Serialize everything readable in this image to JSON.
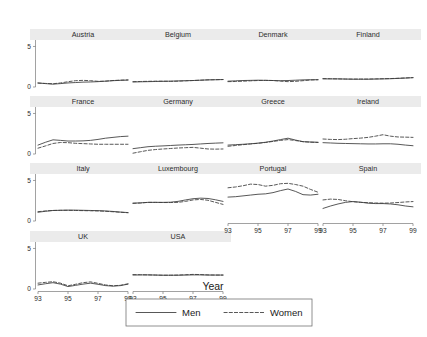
{
  "chart_data": {
    "type": "line",
    "title": "",
    "xlabel": "Year",
    "ylabel": "",
    "xlim": [
      93,
      99
    ],
    "ylim": [
      0,
      5.8
    ],
    "xticks": [
      93,
      95,
      97,
      99
    ],
    "xtick_labels": [
      "93",
      "95",
      "97",
      "99"
    ],
    "yticks": [
      0,
      5
    ],
    "ytick_labels": [
      "0",
      "5"
    ],
    "grid": false,
    "legend_position": "bottom-center",
    "legend": [
      {
        "name": "Men",
        "style": "solid"
      },
      {
        "name": "Women",
        "style": "dashed"
      }
    ],
    "x": [
      93,
      93.5,
      94,
      94.5,
      95,
      95.5,
      96,
      96.5,
      97,
      97.5,
      98,
      98.5,
      99
    ],
    "panels": [
      {
        "label": "Austria",
        "row": 0,
        "col": 0,
        "series": [
          {
            "name": "Men",
            "values": [
              0.5,
              0.42,
              0.35,
              0.42,
              0.5,
              0.55,
              0.6,
              0.62,
              0.66,
              0.72,
              0.78,
              0.82,
              0.85
            ]
          },
          {
            "name": "Women",
            "values": [
              0.48,
              0.44,
              0.4,
              0.5,
              0.65,
              0.78,
              0.82,
              0.78,
              0.7,
              0.72,
              0.8,
              0.85,
              0.88
            ]
          }
        ]
      },
      {
        "label": "Belgium",
        "row": 0,
        "col": 1,
        "series": [
          {
            "name": "Men",
            "values": [
              0.62,
              0.64,
              0.66,
              0.68,
              0.7,
              0.72,
              0.75,
              0.78,
              0.8,
              0.84,
              0.88,
              0.9,
              0.92
            ]
          },
          {
            "name": "Women",
            "values": [
              0.66,
              0.68,
              0.7,
              0.72,
              0.72,
              0.7,
              0.72,
              0.76,
              0.8,
              0.84,
              0.88,
              0.9,
              0.92
            ]
          }
        ]
      },
      {
        "label": "Denmark",
        "row": 0,
        "col": 2,
        "series": [
          {
            "name": "Men",
            "values": [
              0.72,
              0.76,
              0.8,
              0.82,
              0.84,
              0.82,
              0.8,
              0.78,
              0.8,
              0.84,
              0.88,
              0.9,
              0.9
            ]
          },
          {
            "name": "Women",
            "values": [
              0.66,
              0.68,
              0.72,
              0.76,
              0.8,
              0.82,
              0.8,
              0.72,
              0.66,
              0.7,
              0.78,
              0.86,
              0.9
            ]
          }
        ]
      },
      {
        "label": "Finland",
        "row": 0,
        "col": 3,
        "series": [
          {
            "name": "Men",
            "values": [
              1.0,
              1.0,
              1.0,
              0.98,
              0.96,
              0.96,
              0.96,
              0.98,
              1.0,
              1.02,
              1.06,
              1.1,
              1.15
            ]
          },
          {
            "name": "Women",
            "values": [
              1.04,
              1.02,
              1.0,
              0.98,
              0.98,
              0.98,
              0.98,
              1.0,
              1.02,
              1.04,
              1.08,
              1.12,
              1.16
            ]
          }
        ]
      },
      {
        "label": "France",
        "row": 1,
        "col": 0,
        "series": [
          {
            "name": "Men",
            "values": [
              1.1,
              1.45,
              1.75,
              1.68,
              1.6,
              1.6,
              1.62,
              1.68,
              1.8,
              1.95,
              2.05,
              2.15,
              2.2
            ]
          },
          {
            "name": "Women",
            "values": [
              0.72,
              1.0,
              1.3,
              1.42,
              1.4,
              1.32,
              1.28,
              1.24,
              1.2,
              1.2,
              1.2,
              1.2,
              1.2
            ]
          }
        ]
      },
      {
        "label": "Germany",
        "row": 1,
        "col": 1,
        "series": [
          {
            "name": "Men",
            "values": [
              0.66,
              0.78,
              0.9,
              0.96,
              1.0,
              1.05,
              1.1,
              1.14,
              1.18,
              1.24,
              1.3,
              1.34,
              1.38
            ]
          },
          {
            "name": "Women",
            "values": [
              0.1,
              0.28,
              0.45,
              0.55,
              0.62,
              0.68,
              0.74,
              0.78,
              0.82,
              0.72,
              0.62,
              0.6,
              0.62
            ]
          }
        ]
      },
      {
        "label": "Greece",
        "row": 1,
        "col": 2,
        "series": [
          {
            "name": "Men",
            "values": [
              1.1,
              1.15,
              1.2,
              1.26,
              1.34,
              1.45,
              1.6,
              1.78,
              1.95,
              1.72,
              1.52,
              1.48,
              1.45
            ]
          },
          {
            "name": "Women",
            "values": [
              0.95,
              1.05,
              1.15,
              1.24,
              1.32,
              1.42,
              1.55,
              1.68,
              1.78,
              1.66,
              1.52,
              1.46,
              1.42
            ]
          }
        ]
      },
      {
        "label": "Ireland",
        "row": 1,
        "col": 3,
        "series": [
          {
            "name": "Men",
            "values": [
              1.4,
              1.36,
              1.32,
              1.3,
              1.28,
              1.26,
              1.24,
              1.24,
              1.26,
              1.26,
              1.2,
              1.1,
              1.02
            ]
          },
          {
            "name": "Women",
            "values": [
              1.85,
              1.8,
              1.78,
              1.82,
              1.9,
              1.96,
              2.05,
              2.2,
              2.38,
              2.2,
              2.1,
              2.08,
              2.05
            ]
          }
        ]
      },
      {
        "label": "Italy",
        "row": 2,
        "col": 0,
        "series": [
          {
            "name": "Men",
            "values": [
              1.08,
              1.2,
              1.3,
              1.32,
              1.34,
              1.34,
              1.32,
              1.3,
              1.28,
              1.24,
              1.18,
              1.1,
              1.04
            ]
          },
          {
            "name": "Women",
            "values": [
              1.15,
              1.24,
              1.3,
              1.32,
              1.32,
              1.3,
              1.28,
              1.26,
              1.24,
              1.2,
              1.14,
              1.08,
              1.02
            ]
          }
        ]
      },
      {
        "label": "Luxembourg",
        "row": 2,
        "col": 1,
        "series": [
          {
            "name": "Men",
            "values": [
              2.2,
              2.24,
              2.3,
              2.3,
              2.3,
              2.32,
              2.42,
              2.6,
              2.75,
              2.82,
              2.78,
              2.62,
              2.42
            ]
          },
          {
            "name": "Women",
            "values": [
              2.18,
              2.22,
              2.3,
              2.3,
              2.28,
              2.28,
              2.3,
              2.42,
              2.6,
              2.66,
              2.56,
              2.3,
              2.05
            ]
          }
        ]
      },
      {
        "label": "Portugal",
        "row": 2,
        "col": 2,
        "series": [
          {
            "name": "Men",
            "values": [
              2.95,
              3.0,
              3.1,
              3.2,
              3.3,
              3.35,
              3.5,
              3.75,
              3.95,
              3.65,
              3.25,
              3.2,
              3.3
            ]
          },
          {
            "name": "Women",
            "values": [
              4.1,
              4.2,
              4.35,
              4.55,
              4.5,
              4.3,
              4.4,
              4.6,
              4.65,
              4.5,
              4.3,
              3.9,
              3.55
            ]
          }
        ]
      },
      {
        "label": "Spain",
        "row": 2,
        "col": 3,
        "series": [
          {
            "name": "Men",
            "values": [
              1.55,
              1.85,
              2.1,
              2.3,
              2.4,
              2.32,
              2.2,
              2.15,
              2.15,
              2.1,
              2.0,
              1.85,
              1.75
            ]
          },
          {
            "name": "Women",
            "values": [
              2.6,
              2.7,
              2.66,
              2.5,
              2.38,
              2.3,
              2.26,
              2.22,
              2.2,
              2.22,
              2.28,
              2.35,
              2.4
            ]
          }
        ]
      },
      {
        "label": "UK",
        "row": 3,
        "col": 0,
        "series": [
          {
            "name": "Men",
            "values": [
              0.5,
              0.65,
              0.78,
              0.6,
              0.3,
              0.45,
              0.6,
              0.72,
              0.58,
              0.42,
              0.35,
              0.42,
              0.6
            ]
          },
          {
            "name": "Women",
            "values": [
              0.72,
              0.82,
              0.9,
              0.72,
              0.4,
              0.58,
              0.78,
              0.88,
              0.7,
              0.5,
              0.4,
              0.46,
              0.64
            ]
          }
        ]
      },
      {
        "label": "USA",
        "row": 3,
        "col": 1,
        "series": [
          {
            "name": "Men",
            "values": [
              1.72,
              1.74,
              1.74,
              1.72,
              1.7,
              1.7,
              1.7,
              1.72,
              1.74,
              1.74,
              1.72,
              1.72,
              1.72
            ]
          },
          {
            "name": "Women",
            "values": [
              1.78,
              1.76,
              1.74,
              1.72,
              1.7,
              1.7,
              1.72,
              1.76,
              1.8,
              1.78,
              1.74,
              1.72,
              1.72
            ]
          }
        ]
      }
    ]
  }
}
